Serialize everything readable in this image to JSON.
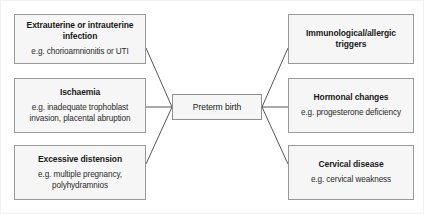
{
  "diagram": {
    "type": "flow-diagram",
    "layout": "causes-fan-into-center-outcome",
    "center": {
      "id": "preterm-birth",
      "title": "Preterm birth",
      "subtitle": ""
    },
    "left_nodes": [
      {
        "id": "infection",
        "title": "Extrauterine or intrauterine infection",
        "subtitle": "e.g. chorioamnionitis or UTI"
      },
      {
        "id": "ischaemia",
        "title": "Ischaemia",
        "subtitle": "e.g. inadequate trophoblast invasion, placental abruption"
      },
      {
        "id": "excessive-distension",
        "title": "Excessive distension",
        "subtitle": "e.g. multiple pregnancy, polyhydramnios"
      }
    ],
    "right_nodes": [
      {
        "id": "immunological-allergic",
        "title": "Immunological/allergic triggers",
        "subtitle": ""
      },
      {
        "id": "hormonal-changes",
        "title": "Hormonal changes",
        "subtitle": "e.g. progesterone deficiency"
      },
      {
        "id": "cervical-disease",
        "title": "Cervical disease",
        "subtitle": "e.g. cervical weakness"
      }
    ],
    "colors": {
      "node_fill": "#f6f6f6",
      "node_border": "#9a9a9a",
      "connector": "#555555",
      "text": "#1a1a1a",
      "background": "#ffffff"
    }
  }
}
